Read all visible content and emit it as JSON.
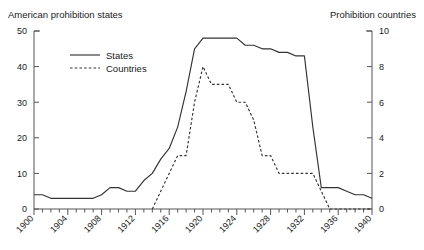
{
  "chart_data": {
    "type": "line",
    "title": "",
    "left_axis_title": "American prohibition states",
    "right_axis_title": "Prohibition countries",
    "xlabel": "",
    "ylabel": "",
    "xlim": [
      1900,
      1940
    ],
    "ylim": [
      0,
      50
    ],
    "y2lim": [
      0,
      10
    ],
    "xticks": [
      1900,
      1904,
      1908,
      1912,
      1916,
      1920,
      1924,
      1928,
      1932,
      1936,
      1940
    ],
    "xtick_labels": [
      "1900",
      "1904",
      "1908",
      "1912",
      "1916",
      "1920",
      "1924",
      "1928",
      "1932",
      "1936",
      "1940"
    ],
    "xminor_step": 1,
    "yticks": [
      0,
      10,
      20,
      30,
      40,
      50
    ],
    "ytick_labels": [
      "0",
      "10",
      "20",
      "30",
      "40",
      "50"
    ],
    "y2ticks": [
      0,
      2,
      4,
      6,
      8,
      10
    ],
    "y2tick_labels": [
      "0",
      "2",
      "4",
      "6",
      "8",
      "10"
    ],
    "grid": false,
    "legend_position": "upper-left-inside",
    "x": [
      1900,
      1901,
      1902,
      1903,
      1904,
      1905,
      1906,
      1907,
      1908,
      1909,
      1910,
      1911,
      1912,
      1913,
      1914,
      1915,
      1916,
      1917,
      1918,
      1919,
      1920,
      1921,
      1922,
      1923,
      1924,
      1925,
      1926,
      1927,
      1928,
      1929,
      1930,
      1931,
      1932,
      1933,
      1934,
      1935,
      1936,
      1937,
      1938,
      1939,
      1940
    ],
    "series": [
      {
        "name": "States",
        "axis": "left",
        "style": "solid",
        "color": "#333333",
        "values": [
          4,
          4,
          3,
          3,
          3,
          3,
          3,
          3,
          4,
          6,
          6,
          5,
          5,
          8,
          10,
          14,
          17,
          23,
          33,
          45,
          48,
          48,
          48,
          48,
          48,
          46,
          46,
          45,
          45,
          44,
          44,
          43,
          43,
          23,
          6,
          6,
          6,
          5,
          4,
          4,
          3
        ]
      },
      {
        "name": "Countries",
        "axis": "right",
        "style": "dashed",
        "color": "#333333",
        "values": [
          null,
          null,
          null,
          null,
          null,
          null,
          null,
          null,
          null,
          null,
          null,
          null,
          null,
          null,
          0,
          1,
          2,
          3,
          3,
          6,
          8,
          7,
          7,
          7,
          6,
          6,
          5,
          3,
          3,
          2,
          2,
          2,
          2,
          2,
          1,
          0,
          0,
          0,
          0,
          0,
          0
        ]
      }
    ],
    "legend": [
      {
        "label": "States",
        "style": "solid"
      },
      {
        "label": "Countries",
        "style": "dashed"
      }
    ]
  }
}
